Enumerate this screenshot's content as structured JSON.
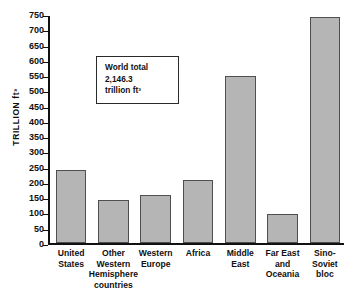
{
  "chart_data": {
    "type": "bar",
    "title": "",
    "subtitle": "",
    "xlabel": "",
    "ylabel": "TRILLION ft³",
    "ylim": [
      0,
      750
    ],
    "ytick_step": 50,
    "grid": false,
    "legend": "none",
    "categories": [
      "United States",
      "Other Western Hemisphere countries",
      "Western Europe",
      "Africa",
      "Middle East",
      "Far East and Oceania",
      "Sino-Soviet bloc"
    ],
    "category_lines": [
      [
        "United",
        "States"
      ],
      [
        "Other",
        "Western",
        "Hemisphere",
        "countries"
      ],
      [
        "Western",
        "Europe"
      ],
      [
        "Africa"
      ],
      [
        "Middle",
        "East"
      ],
      [
        "Far East",
        "and",
        "Oceania"
      ],
      [
        "Sino-",
        "Soviet",
        "bloc"
      ]
    ],
    "values": [
      238,
      141,
      156,
      205,
      548,
      95,
      740
    ],
    "ytick_labels": [
      "750",
      "700",
      "650",
      "600",
      "550",
      "500",
      "450",
      "400",
      "350",
      "300",
      "250",
      "200",
      "150",
      "100",
      "50",
      "0"
    ],
    "ytick_values": [
      750,
      700,
      650,
      600,
      550,
      500,
      450,
      400,
      350,
      300,
      250,
      200,
      150,
      100,
      50,
      0
    ],
    "annotations": [
      {
        "name": "world-total",
        "lines": [
          "World total",
          "2,146.3",
          "trillion ft³"
        ]
      }
    ],
    "colors": {
      "bar_fill": "#b5b5b5",
      "bar_stroke": "#4f4f4f",
      "axis": "#111111",
      "text": "#101010",
      "background": "#ffffff"
    }
  }
}
